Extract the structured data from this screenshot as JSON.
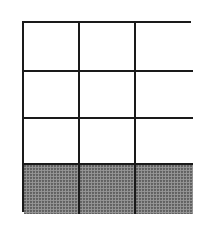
{
  "diagram": {
    "type": "grid",
    "rows": 4,
    "cols": 3,
    "total_cells": 12,
    "shaded_cells": 3,
    "shaded_row": 4,
    "colors": {
      "line": "#1a1a1a",
      "empty": "#ffffff",
      "shaded": "#8c8c8c"
    },
    "cells": [
      [
        {
          "shaded": false
        },
        {
          "shaded": false
        },
        {
          "shaded": false
        }
      ],
      [
        {
          "shaded": false
        },
        {
          "shaded": false
        },
        {
          "shaded": false
        }
      ],
      [
        {
          "shaded": false
        },
        {
          "shaded": false
        },
        {
          "shaded": false
        }
      ],
      [
        {
          "shaded": true
        },
        {
          "shaded": true
        },
        {
          "shaded": true
        }
      ]
    ]
  }
}
